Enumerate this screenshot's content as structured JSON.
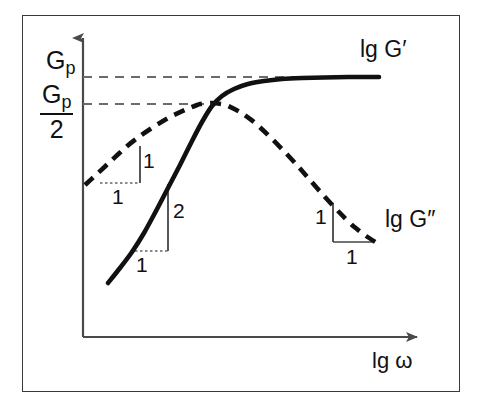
{
  "figure": {
    "background_color": "#ffffff",
    "frame_color": "#3a3a3a",
    "ink_color": "#111111"
  },
  "axes": {
    "y_label_top": "G",
    "y_label_top_sub": "p",
    "y_label_half_num": "G",
    "y_label_half_num_sub": "p",
    "y_label_half_den": "2",
    "x_label": "lg ω"
  },
  "curves": {
    "storage_modulus_label": "lg G′",
    "loss_modulus_label": "lg G″"
  },
  "slope_markers": {
    "dashed_low_freq_rise": {
      "vertical": "1",
      "horizontal": "1"
    },
    "solid_low_freq_rise": {
      "vertical": "2",
      "horizontal": "1"
    },
    "dashed_high_freq_fall": {
      "vertical": "1",
      "horizontal": "1"
    }
  },
  "chart_data": {
    "type": "line",
    "title": "",
    "xlabel": "lg ω",
    "ylabel": "",
    "grid": false,
    "legend_position": "inline-right-of-curves",
    "axis_style": "schematic-arrows",
    "xlim": [
      0,
      1
    ],
    "ylim": [
      0,
      1
    ],
    "y_tick_labels": [
      "G_p",
      "G_p/2"
    ],
    "y_tick_values_px": [
      77,
      104
    ],
    "reference_lines": [
      {
        "name": "G_p plateau level",
        "label": "G_p",
        "orientation": "horizontal",
        "style": "dashed",
        "y_px": 77,
        "x_from_px": 83,
        "x_to_px": 379
      },
      {
        "name": "G_p/2 crossover level",
        "label": "G_p/2",
        "orientation": "horizontal",
        "style": "dashed",
        "y_px": 104,
        "x_from_px": 83,
        "x_to_px": 212
      }
    ],
    "series": [
      {
        "name": "lg G′",
        "style": "solid",
        "linewidth": 4,
        "description": "storage modulus: slope 2 at low frequency, plateau at G_p",
        "points_px": [
          [
            108,
            283
          ],
          [
            120,
            268
          ],
          [
            132,
            252
          ],
          [
            144,
            233
          ],
          [
            156,
            211
          ],
          [
            168,
            188
          ],
          [
            180,
            165
          ],
          [
            192,
            141
          ],
          [
            202,
            122
          ],
          [
            212,
            106
          ],
          [
            222,
            96
          ],
          [
            234,
            89
          ],
          [
            248,
            84
          ],
          [
            264,
            81
          ],
          [
            282,
            79
          ],
          [
            302,
            78
          ],
          [
            324,
            77.5
          ],
          [
            348,
            77
          ],
          [
            379,
            77
          ]
        ]
      },
      {
        "name": "lg G″",
        "style": "dashed",
        "linewidth": 4,
        "description": "loss modulus: slope 1 at low frequency, maximum near crossover, slope -1 at high frequency",
        "points_px": [
          [
            85,
            185
          ],
          [
            98,
            173
          ],
          [
            112,
            160
          ],
          [
            126,
            147
          ],
          [
            140,
            136
          ],
          [
            155,
            126
          ],
          [
            170,
            117
          ],
          [
            185,
            110
          ],
          [
            200,
            104
          ],
          [
            212,
            103
          ],
          [
            226,
            105
          ],
          [
            240,
            112
          ],
          [
            254,
            122
          ],
          [
            268,
            135
          ],
          [
            282,
            149
          ],
          [
            296,
            164
          ],
          [
            310,
            180
          ],
          [
            324,
            196
          ],
          [
            338,
            211
          ],
          [
            352,
            225
          ],
          [
            366,
            236
          ],
          [
            377,
            243
          ]
        ]
      }
    ],
    "annotations": [
      {
        "text": "lg G′",
        "x_px": 360,
        "y_px": 48
      },
      {
        "text": "lg G″",
        "x_px": 385,
        "y_px": 218
      },
      {
        "text": "lg ω",
        "x_px": 372,
        "y_px": 360
      },
      {
        "text": "1",
        "x_px": 143,
        "y_px": 160,
        "role": "slope-rise"
      },
      {
        "text": "1",
        "x_px": 112,
        "y_px": 196,
        "role": "slope-run"
      },
      {
        "text": "2",
        "x_px": 173,
        "y_px": 210,
        "role": "slope-rise"
      },
      {
        "text": "1",
        "x_px": 136,
        "y_px": 264,
        "role": "slope-run"
      },
      {
        "text": "1",
        "x_px": 315,
        "y_px": 216,
        "role": "slope-rise"
      },
      {
        "text": "1",
        "x_px": 346,
        "y_px": 256,
        "role": "slope-run"
      }
    ]
  }
}
